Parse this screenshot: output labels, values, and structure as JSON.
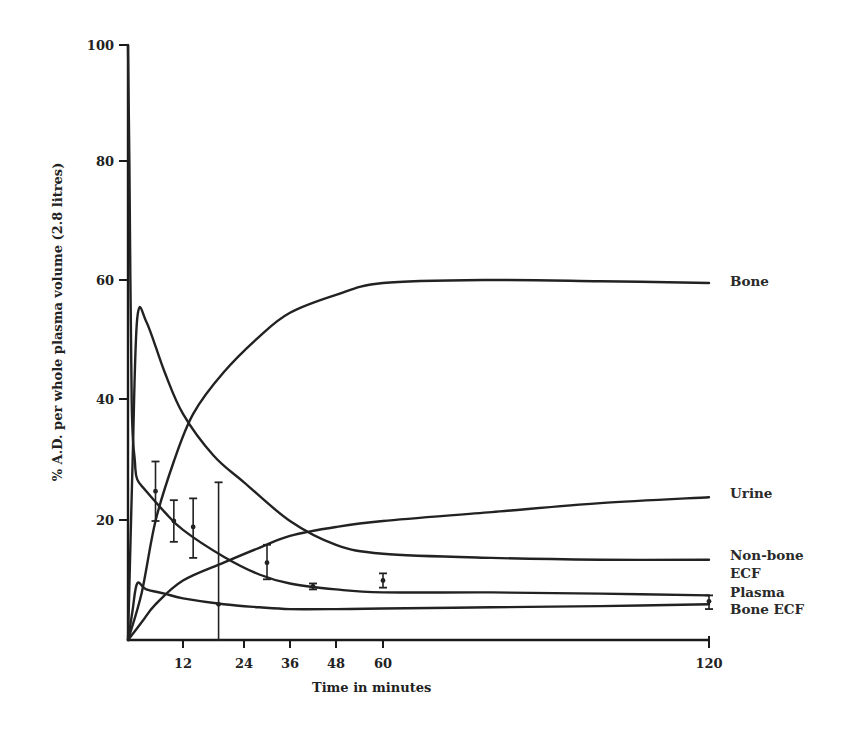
{
  "chart_data": {
    "type": "line",
    "title": "",
    "xlabel": "Time in minutes",
    "ylabel": "% A.D. per whole plasma volume (2.8 litres)",
    "xlim": [
      0,
      120
    ],
    "ylim": [
      0,
      100
    ],
    "grid": false,
    "legend_position": "right, inline labels at curve ends",
    "x_ticks": [
      12,
      24,
      36,
      48,
      60,
      120
    ],
    "y_ticks": [
      20,
      40,
      60,
      80,
      100
    ],
    "series": [
      {
        "name": "Bone",
        "x": [
          0,
          3,
          6,
          10,
          14,
          20,
          28,
          36,
          48,
          60,
          80,
          100,
          120
        ],
        "values": [
          0,
          8,
          20,
          30,
          38,
          45,
          51,
          55,
          58,
          60,
          60.5,
          60.3,
          60
        ]
      },
      {
        "name": "Urine",
        "x": [
          0,
          3,
          6,
          12,
          20,
          28,
          36,
          48,
          60,
          80,
          100,
          120
        ],
        "values": [
          0,
          3,
          6,
          10,
          13,
          15.5,
          17.5,
          19,
          20,
          21.5,
          23,
          24
        ]
      },
      {
        "name": "Non-bone ECF",
        "x": [
          0,
          1,
          2,
          4,
          8,
          12,
          18,
          24,
          36,
          48,
          60,
          80,
          100,
          120
        ],
        "values": [
          0,
          30,
          54,
          53.5,
          45,
          38,
          31,
          26.5,
          20,
          16,
          14.5,
          13.8,
          13.5,
          13.5
        ]
      },
      {
        "name": "Plasma",
        "x": [
          0,
          0.3,
          0.8,
          1.5,
          2,
          4,
          8,
          12,
          20,
          28,
          36,
          48,
          60,
          80,
          100,
          120
        ],
        "values": [
          100,
          80,
          40,
          30,
          27,
          25,
          21.5,
          18.5,
          14,
          11,
          9.5,
          8.5,
          8,
          8,
          7.8,
          7.5
        ]
      },
      {
        "name": "Bone ECF",
        "x": [
          0,
          1,
          2,
          4,
          8,
          12,
          20,
          28,
          36,
          48,
          60,
          80,
          100,
          120
        ],
        "values": [
          0,
          5,
          9.5,
          8.5,
          7.8,
          7,
          6,
          5.5,
          5.2,
          5.2,
          5.3,
          5.5,
          5.7,
          6
        ]
      }
    ],
    "observed_points": {
      "name": "Plasma (measured, mean ± range)",
      "x": [
        6,
        10,
        14,
        19,
        30,
        42,
        60,
        120
      ],
      "values": [
        25,
        20,
        19,
        6,
        13,
        9,
        10,
        6.5
      ],
      "upper": [
        30,
        23.5,
        23.8,
        26.5,
        16,
        9.5,
        11.2,
        7.5
      ],
      "lower": [
        20,
        16.5,
        13.8,
        0,
        10.2,
        8.5,
        8.8,
        5.2
      ]
    },
    "legend": [
      "Bone",
      "Urine",
      "Non-bone ECF",
      "Plasma",
      "Bone ECF"
    ]
  },
  "labels": {
    "xlabel": "Time in minutes",
    "ylabel": "% A.D. per whole plasma volume (2.8 litres)",
    "legend": {
      "bone": "Bone",
      "urine": "Urine",
      "nonbone_line1": "Non-bone",
      "nonbone_line2": "ECF",
      "plasma": "Plasma",
      "bone_ecf": "Bone ECF"
    },
    "x_ticks": [
      "12",
      "24",
      "36",
      "48",
      "60",
      "120"
    ],
    "y_ticks": [
      "100",
      "80",
      "60",
      "40",
      "20"
    ]
  },
  "colors": {
    "ink": "#222222",
    "background": "#ffffff"
  }
}
